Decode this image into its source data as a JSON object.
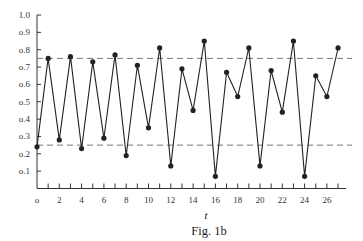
{
  "chart_data": {
    "type": "line",
    "title": "",
    "caption": "Fig. 1b",
    "xlabel": "t",
    "ylabel": "",
    "xlim": [
      0,
      27
    ],
    "ylim": [
      0,
      1.0
    ],
    "grid": false,
    "legend": null,
    "x_ticks": [
      0,
      2,
      4,
      6,
      8,
      10,
      12,
      14,
      16,
      18,
      20,
      22,
      24,
      26
    ],
    "x_minor_ticks": [
      1,
      3,
      5,
      7,
      9,
      11,
      13,
      15,
      17,
      19,
      21,
      23,
      25,
      27
    ],
    "y_ticks": [
      0.1,
      0.2,
      0.3,
      0.4,
      0.5,
      0.6,
      0.7,
      0.8,
      0.9,
      1.0
    ],
    "y_tick_labels": [
      "0.1",
      "0.2",
      "0.3",
      "0.4",
      "0.5",
      "0.6",
      "0.7",
      "0.8",
      "0.9",
      "1.0"
    ],
    "x": [
      0,
      1,
      2,
      3,
      4,
      5,
      6,
      7,
      8,
      9,
      10,
      11,
      12,
      13,
      14,
      15,
      16,
      17,
      18,
      19,
      20,
      21,
      22,
      23,
      24,
      25,
      26,
      27
    ],
    "series": [
      {
        "name": "x_t",
        "marker": "filled-circle",
        "color": "#222222",
        "values": [
          0.24,
          0.75,
          0.28,
          0.76,
          0.23,
          0.73,
          0.29,
          0.77,
          0.19,
          0.71,
          0.35,
          0.81,
          0.13,
          0.69,
          0.45,
          0.85,
          0.07,
          0.67,
          0.53,
          0.81,
          0.13,
          0.68,
          0.44,
          0.85,
          0.07,
          0.65,
          0.53,
          0.81
        ]
      }
    ],
    "reference_lines": [
      {
        "y": 0.75,
        "style": "dashed",
        "color": "#777777"
      },
      {
        "y": 0.25,
        "style": "dashed",
        "color": "#777777"
      }
    ]
  }
}
